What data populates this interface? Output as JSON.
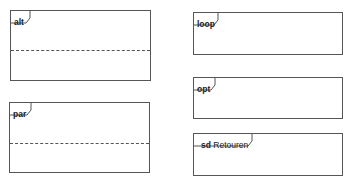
{
  "frames": [
    {
      "id": "alt",
      "operator": "alt",
      "name": "",
      "x": 10,
      "y": 10,
      "w": 141,
      "h": 71,
      "divider_y": 39,
      "tag_w": 17
    },
    {
      "id": "par",
      "operator": "par",
      "name": "",
      "x": 9,
      "y": 102,
      "w": 141,
      "h": 71,
      "divider_y": 40,
      "tag_w": 19
    },
    {
      "id": "loop",
      "operator": "loop",
      "name": "",
      "x": 193,
      "y": 12,
      "w": 150,
      "h": 43,
      "divider_y": null,
      "tag_w": 24
    },
    {
      "id": "opt",
      "operator": "opt",
      "name": "",
      "x": 193,
      "y": 77,
      "w": 150,
      "h": 42,
      "divider_y": null,
      "tag_w": 19
    },
    {
      "id": "sd",
      "operator": "sd",
      "name": "Retouren",
      "x": 193,
      "y": 133,
      "w": 150,
      "h": 43,
      "divider_y": null,
      "tag_w": 55
    }
  ],
  "labels": {
    "alt": "alt",
    "par": "par",
    "loop": "loop",
    "opt": "opt",
    "sd_op": "sd",
    "sd_name": " Retouren"
  },
  "colors": {
    "line": "#555555",
    "background": "#ffffff",
    "text": "#222222"
  }
}
